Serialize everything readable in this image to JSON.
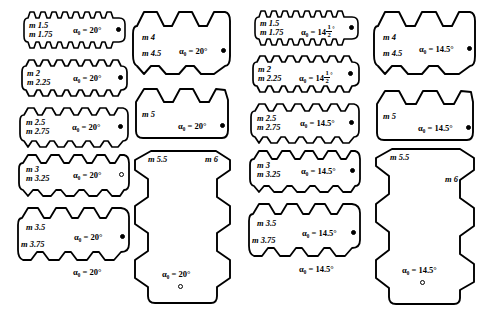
{
  "figure": {
    "type": "engineering-illustration",
    "columns": [
      {
        "id": "col-1",
        "pressure_angle": "20°",
        "blocks": [
          {
            "id": "b1",
            "modules": [
              "m 1.5",
              "m 1.75"
            ],
            "angle_label": "α₀ = 20°",
            "teeth": 9,
            "shape": "horizontal"
          },
          {
            "id": "b2",
            "modules": [
              "m 2",
              "m 2.25"
            ],
            "angle_label": "α₀ = 20°",
            "teeth": 8,
            "shape": "horizontal"
          },
          {
            "id": "b3",
            "modules": [
              "m 2.5",
              "m 2.75"
            ],
            "angle_label": "α₀ = 20°",
            "teeth": 7,
            "shape": "horizontal"
          },
          {
            "id": "b4",
            "modules": [
              "m 3",
              "m 3.25"
            ],
            "angle_label": "α₀ = 20°",
            "teeth": 6,
            "shape": "horizontal"
          },
          {
            "id": "b5",
            "modules": [
              "m 3.5",
              "m 3.75"
            ],
            "angle_label": "α₀ = 20°",
            "teeth": 5,
            "shape": "horizontal"
          }
        ],
        "footer_label": "α₀ = 20°"
      },
      {
        "id": "col-2",
        "pressure_angle": "20°",
        "blocks": [
          {
            "id": "b6",
            "modules": [
              "m 4",
              "m 4.5"
            ],
            "angle_label": "α₀ = 20°",
            "teeth": 4,
            "shape": "horizontal"
          },
          {
            "id": "b7",
            "modules": [
              "m 5"
            ],
            "angle_label": "α₀ = 20°",
            "teeth": 4,
            "shape": "horizontal"
          },
          {
            "id": "b8",
            "modules": [
              "m 5.5",
              "m 6"
            ],
            "angle_label": "α₀ = 20°",
            "teeth": 5,
            "shape": "vertical"
          }
        ]
      },
      {
        "id": "col-3",
        "pressure_angle": "14.5°",
        "blocks": [
          {
            "id": "b9",
            "modules": [
              "m 1.5",
              "m 1.75"
            ],
            "angle_label": "α₀ = 14",
            "angle_fraction": {
              "numerator": "1",
              "denominator": "2"
            },
            "angle_suffix": "°",
            "teeth": 9,
            "shape": "horizontal"
          },
          {
            "id": "b10",
            "modules": [
              "m 2",
              "m 2.25"
            ],
            "angle_label": "α₀ = 14",
            "angle_fraction": {
              "numerator": "1",
              "denominator": "2"
            },
            "angle_suffix": "°",
            "teeth": 8,
            "shape": "horizontal"
          },
          {
            "id": "b11",
            "modules": [
              "m 2.5",
              "m 2.75"
            ],
            "angle_label": "α₀ = 14.5°",
            "teeth": 7,
            "shape": "horizontal"
          },
          {
            "id": "b12",
            "modules": [
              "m 3",
              "m 3.25"
            ],
            "angle_label": "α₀ = 14.5°",
            "teeth": 6,
            "shape": "horizontal"
          },
          {
            "id": "b13",
            "modules": [
              "m 3.5",
              "m 3.75"
            ],
            "angle_label": "α₀ = 14.5°",
            "teeth": 5,
            "shape": "horizontal"
          }
        ],
        "footer_label": "α₀ = 14.5°"
      },
      {
        "id": "col-4",
        "pressure_angle": "14.5°",
        "blocks": [
          {
            "id": "b14",
            "modules": [
              "m 4",
              "m 4.5"
            ],
            "angle_label": "α₀ = 14.5°",
            "teeth": 4,
            "shape": "horizontal"
          },
          {
            "id": "b15",
            "modules": [
              "m 5"
            ],
            "angle_label": "α₀ = 14.5°",
            "teeth": 4,
            "shape": "horizontal"
          },
          {
            "id": "b16",
            "modules": [
              "m 5.5",
              "m 6"
            ],
            "angle_label": "α₀ = 14.5°",
            "teeth": 5,
            "shape": "vertical"
          }
        ]
      }
    ],
    "labels": {
      "b1_m1": "m 1.5",
      "b1_m2": "m 1.75",
      "b1_angle": "α₀ = 20°",
      "b2_m1": "m 2",
      "b2_m2": "m 2.25",
      "b2_angle": "α₀ = 20°",
      "b3_m1": "m 2.5",
      "b3_m2": "m 2.75",
      "b3_angle": "α₀ = 20°",
      "b4_m1": "m 3",
      "b4_m2": "m 3.25",
      "b4_angle": "α₀ = 20°",
      "b5_m1": "m 3.5",
      "b5_m2": "m 3.75",
      "b5_angle": "α₀ = 20°",
      "col1_footer": "α₀ = 20°",
      "b6_m1": "m 4",
      "b6_m2": "m 4.5",
      "b6_angle": "α₀ = 20°",
      "b7_m1": "m 5",
      "b7_angle": "α₀ = 20°",
      "b8_m1": "m 5.5",
      "b8_m2": "m 6",
      "b8_angle": "α₀ = 20°",
      "b9_m1": "m 1.5",
      "b9_m2": "m 1.75",
      "b10_m1": "m 2",
      "b10_m2": "m 2.25",
      "b11_m1": "m 2.5",
      "b11_m2": "m 2.75",
      "b11_angle": "α₀ = 14.5°",
      "b12_m1": "m 3",
      "b12_m2": "m 3.25",
      "b12_angle": "α₀ = 14.5°",
      "b13_m1": "m 3.5",
      "b13_m2": "m 3.75",
      "b13_angle": "α₀ = 14.5°",
      "col3_footer": "α₀ = 14.5°",
      "b14_m1": "m 4",
      "b14_m2": "m 4.5",
      "b14_angle": "α₀ = 14.5°",
      "b15_m1": "m 5",
      "b15_angle": "α₀ = 14.5°",
      "b16_m1": "m 5.5",
      "b16_m2": "m 6",
      "b16_angle": "α₀ = 14.5°",
      "frac_num": "1",
      "frac_den": "2",
      "alpha_eq_14": "α₀ = 14",
      "degree": "°"
    },
    "colors": {
      "stroke": "#000000",
      "background": "#ffffff"
    }
  }
}
